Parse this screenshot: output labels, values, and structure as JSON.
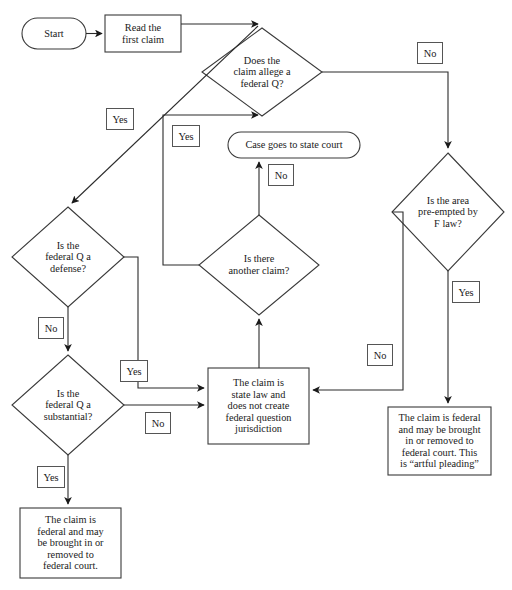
{
  "diagram": {
    "stroke_color": "#2b2b2b",
    "shape_fill": "#ffffff",
    "text_color": "#1a1a1a",
    "nodes": {
      "start": {
        "label": "Start",
        "shape": "terminator"
      },
      "read_claim": {
        "label": "Read the\nfirst claim",
        "shape": "process"
      },
      "alleges_fq": {
        "label": "Does the\nclaim allege a\nfederal Q?",
        "shape": "decision"
      },
      "preempted": {
        "label": "Is the area\npre-empted by\nF law?",
        "shape": "decision"
      },
      "is_defense": {
        "label": "Is the\nfederal Q a\ndefense?",
        "shape": "decision"
      },
      "is_substantial": {
        "label": "Is the\nfederal Q a\nsubstantial?",
        "shape": "decision"
      },
      "another_claim": {
        "label": "Is there\nanother claim?",
        "shape": "decision"
      },
      "state_court": {
        "label": "Case goes to state court",
        "shape": "terminator"
      },
      "state_law_claim": {
        "label": "The claim is\nstate law and\ndoes not create\nfederal question\njurisdiction",
        "shape": "process"
      },
      "federal_artful": {
        "label": "The claim is federal\nand may be brought\nin or removed to\nfederal court. This\nis “artful pleading”",
        "shape": "process"
      },
      "federal_claim": {
        "label": "The claim is\nfederal and may\nbe brought in or\nremoved to\nfederal court.",
        "shape": "process"
      }
    },
    "edge_labels": {
      "fq_no": "No",
      "defense_yes": "Yes",
      "another_claim_yes_up": "Yes",
      "another_claim_no": "No",
      "defense_no": "No",
      "substantial_yes_right": "Yes",
      "substantial_no": "No",
      "substantial_yes_down": "Yes",
      "preempted_yes": "Yes",
      "preempted_no": "No"
    }
  }
}
